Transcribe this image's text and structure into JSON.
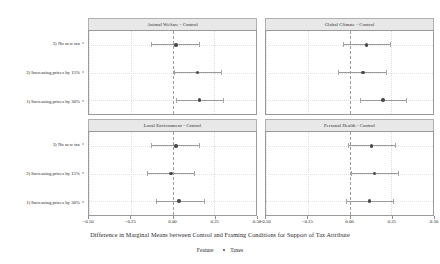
{
  "chart_data": {
    "type": "scatter",
    "title": "",
    "xlabel": "Difference in Marginal Means between Control and Framing Conditions for Support of Tax Attribute",
    "ylabel": "",
    "xlim": [
      -0.5,
      0.5
    ],
    "xticks": [
      -0.5,
      -0.25,
      0,
      0.25,
      0.5
    ],
    "xticklabels": [
      "-0.50",
      "-0.25",
      "0.00",
      "0.25",
      "0.50"
    ],
    "grid": true,
    "reference_line": 0.0,
    "legend": {
      "position": "bottom",
      "title": "Feature",
      "entries": [
        "Taxes"
      ],
      "marker_color": "#4a4a4a"
    },
    "categories": [
      "3) No new tax",
      "2) Increasing prices by 15%",
      "1) Increasing prices by 30%"
    ],
    "facets": [
      {
        "label": "Animal Welfare - Control",
        "row": 0,
        "col": 0,
        "points": [
          {
            "category": "3) No new tax",
            "estimate": 0.02,
            "ci_low": -0.13,
            "ci_high": 0.16
          },
          {
            "category": "2) Increasing prices by 15%",
            "estimate": 0.15,
            "ci_low": 0.01,
            "ci_high": 0.29
          },
          {
            "category": "1) Increasing prices by 30%",
            "estimate": 0.16,
            "ci_low": 0.02,
            "ci_high": 0.3
          }
        ]
      },
      {
        "label": "Global Climate - Control",
        "row": 0,
        "col": 1,
        "points": [
          {
            "category": "3) No new tax",
            "estimate": 0.1,
            "ci_low": -0.04,
            "ci_high": 0.24
          },
          {
            "category": "2) Increasing prices by 15%",
            "estimate": 0.08,
            "ci_low": -0.07,
            "ci_high": 0.22
          },
          {
            "category": "1) Increasing prices by 30%",
            "estimate": 0.2,
            "ci_low": 0.06,
            "ci_high": 0.34
          }
        ]
      },
      {
        "label": "Local Environment - Control",
        "row": 1,
        "col": 0,
        "points": [
          {
            "category": "3) No new tax",
            "estimate": 0.02,
            "ci_low": -0.13,
            "ci_high": 0.16
          },
          {
            "category": "2) Increasing prices by 15%",
            "estimate": -0.01,
            "ci_low": -0.15,
            "ci_high": 0.13
          },
          {
            "category": "1) Increasing prices by 30%",
            "estimate": 0.04,
            "ci_low": -0.1,
            "ci_high": 0.19
          }
        ]
      },
      {
        "label": "Personal Health - Control",
        "row": 1,
        "col": 1,
        "points": [
          {
            "category": "3) No new tax",
            "estimate": 0.13,
            "ci_low": -0.01,
            "ci_high": 0.27
          },
          {
            "category": "2) Increasing prices by 15%",
            "estimate": 0.15,
            "ci_low": 0.01,
            "ci_high": 0.29
          },
          {
            "category": "1) Increasing prices by 30%",
            "estimate": 0.12,
            "ci_low": -0.02,
            "ci_high": 0.26
          }
        ]
      }
    ]
  }
}
